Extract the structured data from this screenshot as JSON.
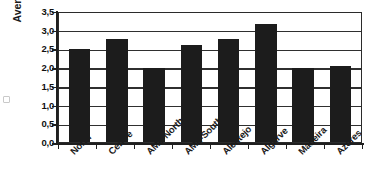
{
  "chart_data": {
    "type": "bar",
    "title": "",
    "subtitle": "",
    "xlabel": "",
    "ylabel": "Average n. of jobs",
    "categories": [
      "North",
      "Centre",
      "AML-North",
      "AML-South",
      "Alentejo",
      "Algarve",
      "Madeira",
      "Azores"
    ],
    "values": [
      2.48,
      2.75,
      1.98,
      2.58,
      2.75,
      3.15,
      1.97,
      2.02
    ],
    "series": [
      {
        "name": "Average n. of jobs",
        "values": [
          2.48,
          2.75,
          1.98,
          2.58,
          2.75,
          3.15,
          1.97,
          2.02
        ],
        "color": "#1c1c1c"
      }
    ],
    "ylim": [
      0.0,
      3.5
    ],
    "ytick_labels": [
      "3,5",
      "3,0",
      "2,5",
      "2,0",
      "1,5",
      "1,0",
      "0,5",
      "0,0"
    ],
    "ytick_values": [
      3.5,
      3.0,
      2.5,
      2.0,
      1.5,
      1.0,
      0.5,
      0.0
    ],
    "grid": true,
    "grid_axis": "y",
    "legend": false,
    "legend_position": "none",
    "bar_color": "#1c1c1c",
    "plot_background": "#ffffff",
    "axis_color": "#1f1f1f",
    "decimal_separator": ","
  }
}
